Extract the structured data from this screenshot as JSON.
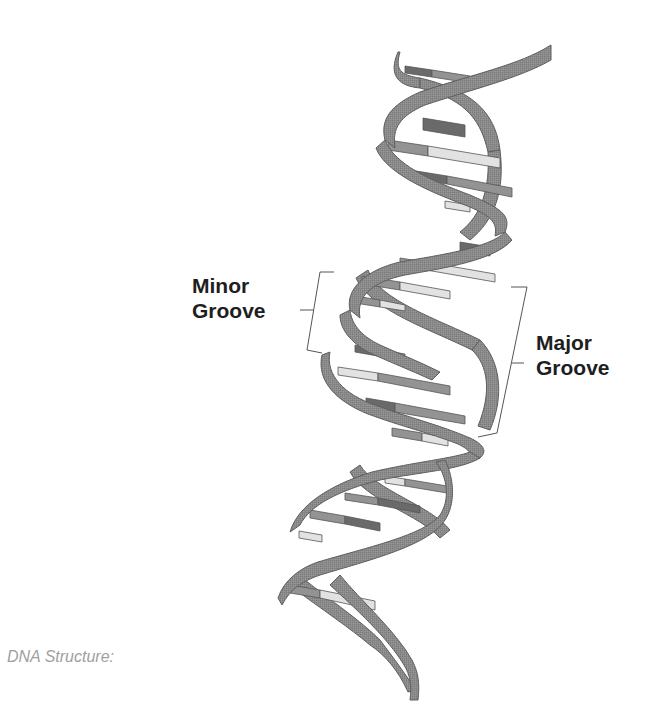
{
  "diagram": {
    "labels": {
      "minor_groove": [
        "Minor",
        "Groove"
      ],
      "major_groove": [
        "Major",
        "Groove"
      ]
    },
    "caption": "DNA Structure:",
    "colors": {
      "background": "#ffffff",
      "backbone": "#8a8a8a",
      "backbone_edge": "#5e5e5e",
      "base_dark": "#6a6a6a",
      "base_mid": "#939393",
      "base_light": "#e2e2e2",
      "label_text": "#1e1e1e",
      "caption_text": "#a0a0a0",
      "bracket": "#555555"
    }
  }
}
